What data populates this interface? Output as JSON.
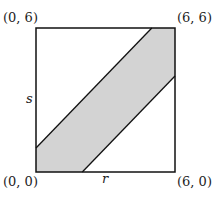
{
  "diagram": {
    "type": "geometric-region",
    "square": {
      "r_range": [
        0,
        6
      ],
      "s_range": [
        0,
        6
      ]
    },
    "corner_labels": {
      "top_left": "(0, 6)",
      "top_right": "(6, 6)",
      "bottom_left": "(0, 0)",
      "bottom_right": "(6, 0)"
    },
    "axis_labels": {
      "horizontal": "r",
      "vertical": "s"
    },
    "shaded_region": {
      "description": "band between two parallel diagonal lines",
      "upper_line": {
        "from": [
          0,
          1
        ],
        "to": [
          5,
          6
        ]
      },
      "lower_line": {
        "from": [
          2,
          0
        ],
        "to": [
          6,
          4
        ]
      },
      "fill_color": "#d3d3d3"
    },
    "colors": {
      "stroke": "#111111",
      "fill": "#d3d3d3",
      "background": "#ffffff"
    }
  }
}
